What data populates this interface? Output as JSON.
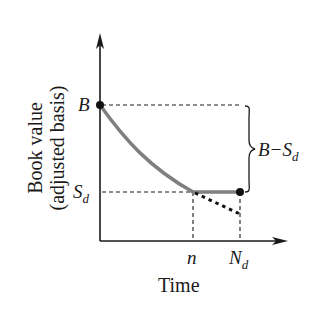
{
  "diagram": {
    "y_axis_label_line1": "Book value",
    "y_axis_label_line2": "(adjusted basis)",
    "x_axis_label": "Time",
    "y_tick_B": "B",
    "y_tick_Sd_main": "S",
    "y_tick_Sd_sub": "d",
    "x_tick_n": "n",
    "x_tick_Nd_main": "N",
    "x_tick_Nd_sub": "d",
    "brace_label_main": "B−S",
    "brace_label_sub": "d",
    "colors": {
      "curve": "#7f7f7f",
      "axes": "#1a1a1a",
      "dashed": "#1a1a1a",
      "points": "#111111"
    }
  }
}
